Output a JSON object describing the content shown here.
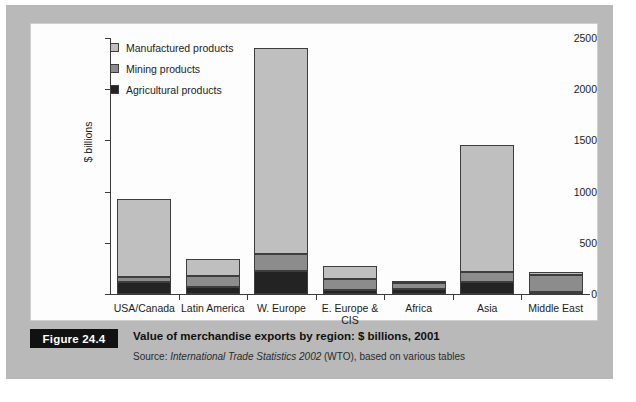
{
  "figure": {
    "tag": "Figure 24.4",
    "title": "Value of merchandise exports by region: $ billions, 2001",
    "source_prefix": "Source: ",
    "source_italic": "International Trade Statistics 2002",
    "source_suffix": " (WTO), based on various tables"
  },
  "colors": {
    "manufactured": "#bfbfbf",
    "mining": "#8c8c8c",
    "agricultural": "#232323",
    "panel_background": "#b9b9b9",
    "plot_background": "#fdfdfd",
    "axis": "#3a3a3a",
    "tag_background": "#111111"
  },
  "chart_data": {
    "type": "bar",
    "stacked": true,
    "title": "Value of merchandise exports by region: $ billions, 2001",
    "xlabel": "",
    "ylabel": "$ billions",
    "ylim": [
      0,
      2500
    ],
    "yticks": [
      0,
      500,
      1000,
      1500,
      2000,
      2500
    ],
    "ytick_labels": [
      "0",
      "500",
      "1000",
      "1500",
      "2000",
      "2500"
    ],
    "grid": false,
    "legend_position": "top-left",
    "categories": [
      "USA/Canada",
      "Latin America",
      "W. Europe",
      "E. Europe & CIS",
      "Africa",
      "Asia",
      "Middle East"
    ],
    "series": [
      {
        "name": "Agricultural products",
        "color": "#232323",
        "values": [
          115,
          65,
          220,
          40,
          45,
          120,
          15
        ]
      },
      {
        "name": "Mining products",
        "color": "#8c8c8c",
        "values": [
          50,
          110,
          170,
          105,
          60,
          90,
          175
        ]
      },
      {
        "name": "Manufactured products",
        "color": "#bfbfbf",
        "values": [
          760,
          165,
          2010,
          125,
          25,
          1245,
          20
        ]
      }
    ],
    "totals": [
      925,
      340,
      2400,
      270,
      130,
      1455,
      210
    ]
  },
  "legend": {
    "items": [
      {
        "label": "Manufactured products",
        "swatch": "#bfbfbf"
      },
      {
        "label": "Mining products",
        "swatch": "#8c8c8c"
      },
      {
        "label": "Agricultural products",
        "swatch": "#232323"
      }
    ]
  }
}
